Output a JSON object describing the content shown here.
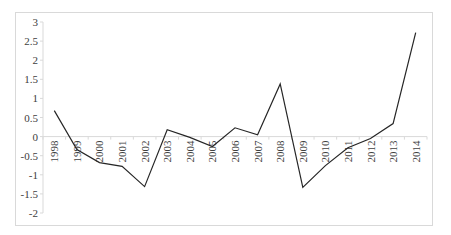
{
  "chart_data": {
    "type": "line",
    "title": "",
    "xlabel": "",
    "ylabel": "",
    "categories": [
      "1998",
      "1999",
      "2000",
      "2001",
      "2002",
      "2003",
      "2004",
      "2005",
      "2006",
      "2007",
      "2008",
      "2009",
      "2010",
      "2011",
      "2012",
      "2013",
      "2014"
    ],
    "series": [
      {
        "name": "Series 1",
        "color": "#262626",
        "values": [
          0.68,
          -0.34,
          -0.68,
          -0.78,
          -1.31,
          0.18,
          -0.02,
          -0.26,
          0.23,
          0.05,
          1.38,
          -1.33,
          -0.76,
          -0.29,
          -0.05,
          0.34,
          2.72
        ]
      }
    ],
    "ylim": [
      -2,
      3
    ],
    "yticks": [
      3,
      2.5,
      2,
      1.5,
      1,
      0.5,
      0,
      -0.5,
      -1,
      -1.5,
      -2
    ],
    "ytick_labels": [
      "3",
      "2.5",
      "2",
      "1.5",
      "1",
      "0.5",
      "0",
      "-0.5",
      "-1",
      "-1.5",
      "-2"
    ],
    "grid": false,
    "legend": "none",
    "x_label_rotation": -90
  }
}
